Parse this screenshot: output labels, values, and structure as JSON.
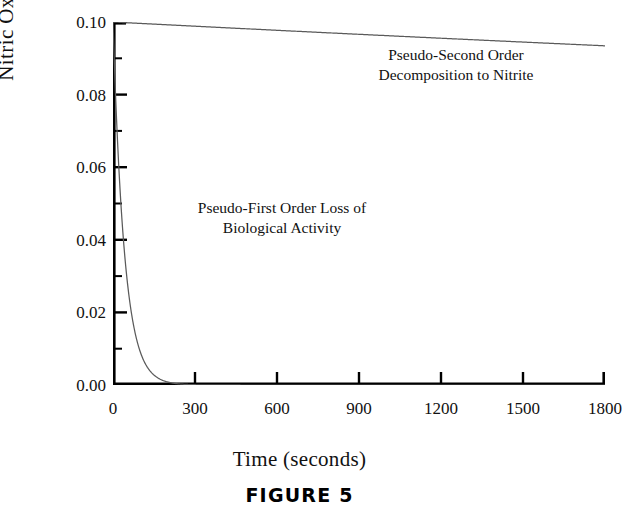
{
  "figure": {
    "caption": "FIGURE  5",
    "xlabel": "Time (seconds)",
    "ylabel": "Nitric Oxide [μM]"
  },
  "annotations": {
    "second_order": "Pseudo-Second Order\nDecomposition to Nitrite",
    "first_order": "Pseudo-First Order Loss of\nBiological Activity"
  },
  "axes": {
    "y_ticks": [
      "0.10",
      "0.08",
      "0.06",
      "0.04",
      "0.02",
      "0.00"
    ],
    "x_ticks": [
      "0",
      "300",
      "600",
      "900",
      "1200",
      "1500",
      "1800"
    ]
  },
  "chart_data": {
    "type": "line",
    "title": "",
    "xlabel": "Time (seconds)",
    "ylabel": "Nitric Oxide [μM]",
    "xlim": [
      0,
      1800
    ],
    "ylim": [
      0.0,
      0.1
    ],
    "xticks": [
      0,
      300,
      600,
      900,
      1200,
      1500,
      1800
    ],
    "yticks": [
      0.0,
      0.02,
      0.04,
      0.06,
      0.08,
      0.1
    ],
    "y_minor_tick_step": 0.01,
    "grid": false,
    "legend": "none (curves labeled by inline annotations)",
    "line_color": "#555555",
    "axis_color": "#000000",
    "series": [
      {
        "name": "Pseudo-Second Order Decomposition to Nitrite",
        "annotation": "Pseudo-Second Order\nDecomposition to Nitrite",
        "model": "second-order decay: C = C0 / (1 + k*C0*t)",
        "C0": 0.1,
        "k_estimate": 0.00039,
        "x": [
          0,
          100,
          200,
          300,
          400,
          500,
          600,
          700,
          800,
          900,
          1000,
          1100,
          1200,
          1300,
          1400,
          1500,
          1600,
          1700,
          1800
        ],
        "values": [
          0.1,
          0.0962,
          0.0927,
          0.0894,
          0.0865,
          0.0837,
          0.0811,
          0.0787,
          0.0764,
          0.0743,
          0.0723,
          0.0704,
          0.0686,
          0.0669,
          0.0653,
          0.0638,
          0.0624,
          0.061,
          0.0597
        ]
      },
      {
        "name": "Pseudo-First Order Loss of Biological Activity",
        "annotation": "Pseudo-First Order Loss of\nBiological Activity",
        "model": "first-order decay: C = C0 * exp(-k*t)",
        "C0": 0.1,
        "k_estimate": 0.024,
        "x": [
          0,
          20,
          40,
          60,
          80,
          100,
          120,
          140,
          160,
          180,
          200,
          220,
          240,
          260,
          300,
          400,
          600,
          900,
          1200,
          1500,
          1800
        ],
        "values": [
          0.1,
          0.0619,
          0.0383,
          0.0237,
          0.0147,
          0.0091,
          0.0056,
          0.0035,
          0.0021,
          0.0013,
          0.0008,
          0.0005,
          0.0003,
          0.0002,
          0.0001,
          0.0,
          0.0,
          0.0,
          0.0,
          0.0,
          0.0
        ]
      }
    ]
  }
}
